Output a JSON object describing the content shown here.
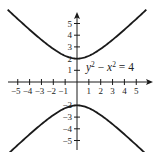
{
  "chart_data": {
    "type": "line",
    "title": "",
    "xlabel": "",
    "ylabel": "",
    "xlim": [
      -5.8,
      6.5
    ],
    "ylim": [
      -5.8,
      5.9
    ],
    "grid": false,
    "x_ticks": [
      -5,
      -4,
      -3,
      -2,
      -1,
      1,
      2,
      3,
      4,
      5
    ],
    "y_ticks": [
      -5,
      -4,
      -3,
      -2,
      1,
      2,
      3,
      4,
      5
    ],
    "x_tick_labels": [
      "−5",
      "−4",
      "−3",
      "−2",
      "−1",
      "1",
      "2",
      "3",
      "4",
      "5"
    ],
    "y_tick_labels": [
      "−5",
      "−4",
      "−3",
      "−2",
      "1",
      "2",
      "3",
      "4",
      "5"
    ],
    "series": [
      {
        "name": "upper branch",
        "equation": "y = sqrt(x^2 + 4)",
        "x": [
          -5.8,
          -5,
          -4,
          -3,
          -2,
          -1,
          0,
          1,
          2,
          3,
          4,
          5,
          5.8
        ],
        "y": [
          6.14,
          5.39,
          4.47,
          3.61,
          2.83,
          2.24,
          2,
          2.24,
          2.83,
          3.61,
          4.47,
          5.39,
          6.14
        ]
      },
      {
        "name": "lower branch",
        "equation": "y = -sqrt(x^2 + 4)",
        "x": [
          -5.8,
          -5,
          -4,
          -3,
          -2,
          -1,
          0,
          1,
          2,
          3,
          4,
          5,
          5.8
        ],
        "y": [
          -6.14,
          -5.39,
          -4.47,
          -3.61,
          -2.83,
          -2.24,
          -2,
          -2.24,
          -2.83,
          -3.61,
          -4.47,
          -5.39,
          -6.14
        ]
      }
    ],
    "annotations": [
      {
        "text": "y² − x² = 4",
        "x": 0.8,
        "y": 1.0
      }
    ]
  },
  "labels": {
    "eq_y": "y",
    "eq_sup1": "2",
    "eq_minus": " − ",
    "eq_x": "x",
    "eq_sup2": "2",
    "eq_rhs": " = 4"
  },
  "style": {
    "curve_color": "#1a1a1a",
    "axis_color": "#1a1a1a",
    "background": "#ffffff"
  }
}
